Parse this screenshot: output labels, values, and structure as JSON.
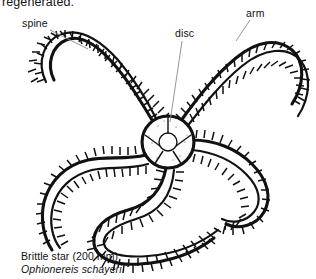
{
  "page": {
    "background": "#ffffff",
    "ink": "#111111",
    "width": 316,
    "height": 279
  },
  "top_text": {
    "fragment": "regenerated.",
    "note": "partially cropped line of body text at very top edge"
  },
  "labels": [
    {
      "id": "spine",
      "text": "spine",
      "x": 22,
      "y": 17,
      "leader": {
        "from": [
          50,
          30
        ],
        "to": [
          88,
          49
        ]
      }
    },
    {
      "id": "disc",
      "text": "disc",
      "x": 175,
      "y": 27,
      "leader": {
        "from": [
          182,
          41
        ],
        "to": [
          170,
          122
        ]
      }
    },
    {
      "id": "arm",
      "text": "arm",
      "x": 246,
      "y": 7,
      "leader": {
        "from": [
          250,
          20
        ],
        "to": [
          236,
          41
        ]
      }
    }
  ],
  "caption": {
    "common_name": "Brittle star (200 mm)",
    "scientific_name": "Ophionereis schayeri"
  },
  "figure": {
    "subject": "brittle star",
    "disc": {
      "center": [
        168,
        142
      ],
      "radius": 25,
      "inner_radius": 9,
      "plate_count": 5
    },
    "arm_count": 5,
    "arm_description": "five long sinuous spine-fringed arms radiating from central disc",
    "icon": "brittle-star-illustration"
  }
}
